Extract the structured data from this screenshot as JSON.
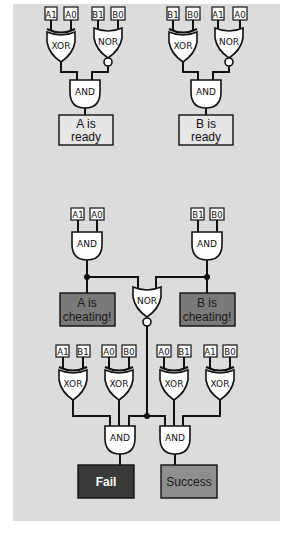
{
  "colors": {
    "panel": "#dcdcdc",
    "ready_box": "#e6e6e6",
    "cheating_box": "#7a7a7a",
    "fail_box": "#3a3a3a",
    "success_box": "#8e8e8e",
    "wire": "#111111"
  },
  "section_ready_a": {
    "inputs": [
      "A1",
      "A0",
      "B1",
      "B0"
    ],
    "gates": [
      "XOR",
      "NOR",
      "AND"
    ],
    "output": [
      "A is",
      "ready"
    ]
  },
  "section_ready_b": {
    "inputs": [
      "B1",
      "B0",
      "A1",
      "A0"
    ],
    "gates": [
      "XOR",
      "NOR",
      "AND"
    ],
    "output": [
      "B is",
      "ready"
    ]
  },
  "section_cheating": {
    "a_inputs": [
      "A1",
      "A0"
    ],
    "b_inputs": [
      "B1",
      "B0"
    ],
    "a_gate": "AND",
    "b_gate": "AND",
    "nor_gate": "NOR",
    "a_output": [
      "A is",
      "cheating!"
    ],
    "b_output": [
      "B is",
      "cheating!"
    ]
  },
  "section_result": {
    "inputs": [
      "A1",
      "B1",
      "A0",
      "B0",
      "A0",
      "B1",
      "A1",
      "B0"
    ],
    "xor_gates": [
      "XOR",
      "XOR",
      "XOR",
      "XOR"
    ],
    "and_gates": [
      "AND",
      "AND"
    ],
    "fail_label": "Fail",
    "success_label": "Success"
  }
}
